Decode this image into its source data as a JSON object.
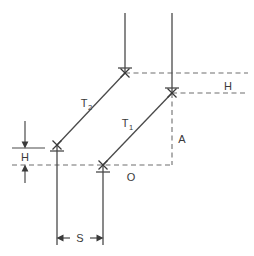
{
  "figure": {
    "kind": "engineering-dimension-diagram",
    "background_color": "#ffffff",
    "solid_line_color": "#4a4a4a",
    "dashed_line_color": "#6e6e6e",
    "text_color": "#3a3a3a"
  },
  "labels": {
    "tangent_upper": "T",
    "tangent_upper_sub": "2",
    "tangent_lower": "T",
    "tangent_lower_sub": "1",
    "height_right": "H",
    "height_left": "H",
    "opposite": "O",
    "adjacent": "A",
    "offset": "S"
  },
  "annotations": [
    {
      "name": "T2",
      "text": "T",
      "subscript": "2",
      "x": 84,
      "y": 103
    },
    {
      "name": "T1",
      "text": "T",
      "subscript": "1",
      "x": 124,
      "y": 123
    },
    {
      "name": "H-right",
      "text": "H",
      "x": 227,
      "y": 90
    },
    {
      "name": "H-left",
      "text": "H",
      "x": 20,
      "y": 161
    },
    {
      "name": "O",
      "text": "O",
      "x": 128,
      "y": 181
    },
    {
      "name": "A",
      "text": "A",
      "x": 179,
      "y": 143
    },
    {
      "name": "S",
      "text": "S",
      "x": 77,
      "y": 242
    }
  ],
  "geometry": {
    "vertical_lines": [
      {
        "name": "top-left-vertical",
        "x": 125,
        "y1": 13,
        "y2": 73
      },
      {
        "name": "top-right-vertical",
        "x": 172,
        "y1": 13,
        "y2": 93
      },
      {
        "name": "lower-left-vertical",
        "x": 57,
        "y1": 145,
        "y2": 245
      },
      {
        "name": "lower-right-vertical",
        "x": 103,
        "y1": 165,
        "y2": 245
      }
    ],
    "diagonals": [
      {
        "name": "T2-diagonal",
        "x1": 57,
        "y1": 145,
        "x2": 125,
        "y2": 73
      },
      {
        "name": "T1-diagonal",
        "x1": 103,
        "y1": 165,
        "x2": 172,
        "y2": 93
      }
    ],
    "dashed_horizontals": [
      {
        "name": "upper-datum",
        "x1": 125,
        "x2": 248,
        "y": 73
      },
      {
        "name": "lower-datum",
        "x1": 172,
        "x2": 248,
        "y": 93
      },
      {
        "name": "base-datum",
        "x1": 12,
        "x2": 172,
        "y": 165
      }
    ],
    "dashed_verticals": [
      {
        "name": "adjacent-leg",
        "x": 172,
        "y1": 93,
        "y2": 165
      }
    ],
    "tick_marks": [
      {
        "name": "tick-top-left",
        "x": 125,
        "y": 68
      },
      {
        "name": "tick-top-right",
        "x": 172,
        "y": 88
      },
      {
        "name": "tick-lower-left",
        "x": 57,
        "y": 151
      },
      {
        "name": "tick-lower-right",
        "x": 103,
        "y": 172
      }
    ],
    "x_markers": [
      {
        "name": "marker-T2-top",
        "x": 125,
        "y": 73
      },
      {
        "name": "marker-T1-top",
        "x": 172,
        "y": 93
      },
      {
        "name": "marker-T2-bottom",
        "x": 57,
        "y": 145
      },
      {
        "name": "marker-T1-bottom",
        "x": 103,
        "y": 165
      }
    ],
    "dimension_H": {
      "name": "H-dimension",
      "x": 25,
      "top_line_y": 148,
      "bottom_line_y": 165,
      "arrow_top_from_y": 121,
      "arrow_bottom_to_y": 183,
      "rule_x1": 12,
      "rule_x2": 45
    },
    "dimension_S": {
      "name": "S-dimension",
      "y": 238,
      "x1": 57,
      "x2": 103
    }
  }
}
